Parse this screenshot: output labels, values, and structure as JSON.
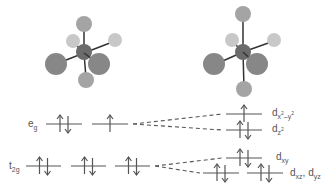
{
  "colors": {
    "background": "#ffffff",
    "line": "#555555",
    "metal_atom": "#6f6f6f",
    "ligand_large": "#8c8c8c",
    "ligand_medium": "#a8a8a8",
    "ligand_light": "#c4c4c4",
    "bond": "#333333"
  },
  "molecules": [
    {
      "name": "octahedral-complex",
      "geometry": "octahedral"
    },
    {
      "name": "tetragonally-elongated-complex",
      "geometry": "elongated octahedral (Jahn-Teller)"
    }
  ],
  "left_levels": {
    "eg": {
      "label_main": "e",
      "label_sub": "g",
      "orbitals": [
        {
          "electrons": "up-down"
        },
        {
          "electrons": "up"
        }
      ]
    },
    "t2g": {
      "label_main": "t",
      "label_sub": "2g",
      "orbitals": [
        {
          "electrons": "up-down"
        },
        {
          "electrons": "up-down"
        },
        {
          "electrons": "up-down"
        }
      ]
    }
  },
  "right_levels": {
    "dx2y2": {
      "label_main": "d",
      "label_sub": "x",
      "label_sup1": "2",
      "label_mid": "–y",
      "label_sup2": "2",
      "electrons": "up"
    },
    "dz2": {
      "label_main": "d",
      "label_sub": "z",
      "label_sup": "2",
      "electrons": "up-down"
    },
    "dxy": {
      "label_main": "d",
      "label_sub": "xy",
      "electrons": "up-down"
    },
    "dxz_dyz": {
      "label_main1": "d",
      "label_sub1": "xz",
      "label_sep": ", ",
      "label_main2": "d",
      "label_sub2": "yz",
      "electrons": [
        "up-down",
        "up-down"
      ]
    }
  }
}
